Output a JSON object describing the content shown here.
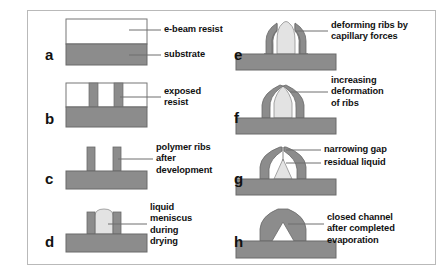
{
  "figure": {
    "type": "process-flow-schematic",
    "colors": {
      "substrate_gray": "#8c8c8c",
      "rib_gray": "#8c8c8c",
      "resist_white": "#ffffff",
      "liquid_light": "#e3e3e3",
      "outline": "#555555",
      "frame_border": "#b9b9b9",
      "text": "#111111",
      "leader_line": "#6f6f6f"
    },
    "panels": [
      {
        "id": "a",
        "letter": "a",
        "labels": [
          {
            "text": "e-beam resist",
            "target": "top white layer"
          },
          {
            "text": "substrate",
            "target": "bottom gray layer"
          }
        ]
      },
      {
        "id": "b",
        "letter": "b",
        "labels": [
          {
            "text": "exposed\nresist",
            "target": "gray vertical bars in resist"
          }
        ]
      },
      {
        "id": "c",
        "letter": "c",
        "labels": [
          {
            "text": "polymer ribs\nafter\ndevelopment",
            "target": "standing ribs"
          }
        ]
      },
      {
        "id": "d",
        "letter": "d",
        "labels": [
          {
            "text": "liquid\nmeniscus\nduring\ndrying",
            "target": "liquid between ribs"
          }
        ]
      },
      {
        "id": "e",
        "letter": "e",
        "labels": [
          {
            "text": "deforming ribs by\ncapillary forces",
            "target": "inward leaning ribs"
          }
        ]
      },
      {
        "id": "f",
        "letter": "f",
        "labels": [
          {
            "text": "increasing\ndeformation\nof ribs",
            "target": "further bent ribs"
          }
        ]
      },
      {
        "id": "g",
        "letter": "g",
        "labels": [
          {
            "text": "narrowing gap",
            "target": "gap at rib tops"
          },
          {
            "text": "residual liquid",
            "target": "remaining liquid at base"
          }
        ]
      },
      {
        "id": "h",
        "letter": "h",
        "labels": [
          {
            "text": "closed channel\nafter completed\nevaporation",
            "target": "sealed triangular channel"
          }
        ]
      }
    ]
  }
}
